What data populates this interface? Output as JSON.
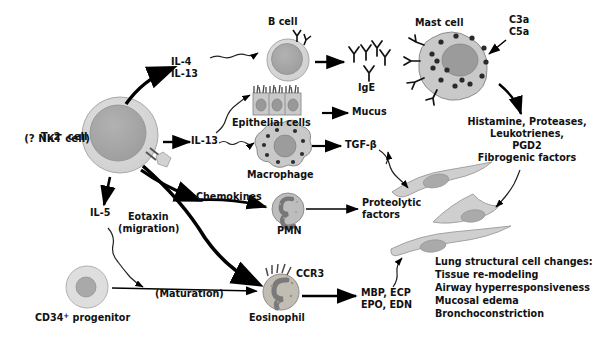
{
  "figure": {
    "type": "biological-pathway-diagram",
    "topic": "TH2 cell driven allergic asthma inflammatory cascade",
    "background": "#ffffff",
    "palette": {
      "cell_fill_light": "#d4d4d4",
      "cell_fill_mid": "#b3b3b3",
      "nucleus": "#9a9a9a",
      "granule": "#3a3a3a",
      "stroke": "#6e6e6e",
      "text": "#111111",
      "arrow": "#000000"
    }
  },
  "cells": {
    "th2": {
      "label_line1": "T",
      "label_sub": "H",
      "label_line1b": "2  cell",
      "label_line2": "(? NKT cell)"
    },
    "bcell": {
      "label": "B cell"
    },
    "epithelial": {
      "label": "Epithelial cells"
    },
    "macrophage": {
      "label": "Macrophage"
    },
    "pmn": {
      "label": "PMN"
    },
    "eosinophil": {
      "label": "Eosinophil",
      "receptor": "CCR3"
    },
    "progenitor": {
      "label_main": "CD34",
      "label_sup": "+",
      "label_rest": " progenitor"
    },
    "mast": {
      "label": "Mast cell"
    },
    "ige": {
      "label": "IgE"
    }
  },
  "mediators": {
    "il4": "IL-4",
    "il13_top": "IL-13",
    "il13_mid": "IL-13",
    "il5": "IL-5",
    "eotaxin_line1": "Eotaxin",
    "eotaxin_line2": "(migration)",
    "maturation": "(Maturation)",
    "chemokines": "Chemokines",
    "mucus": "Mucus",
    "tgfb": "TGF-β",
    "proteolytic_line1": "Proteolytic",
    "proteolytic_line2": "factors",
    "eos_granule_line1": "MBP, ECP",
    "eos_granule_line2": "EPO, EDN",
    "c3a": "C3a",
    "c5a": "C5a"
  },
  "mast_output": {
    "line1": "Histamine, Proteases,",
    "line2": "Leukotrienes,",
    "line3": "PGD2",
    "line4": "Fibrogenic factors"
  },
  "outcome": {
    "title": "Lung structural cell changes:",
    "items": [
      "Tissue re-modeling",
      "Airway hyperresponsiveness",
      "Mucosal edema",
      "Bronchoconstriction"
    ]
  }
}
